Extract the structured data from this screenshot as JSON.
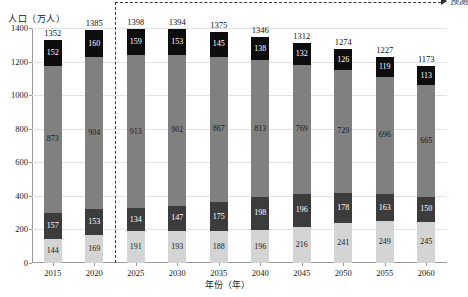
{
  "chart_data": {
    "type": "bar",
    "title": "",
    "subtype": "stacked",
    "xlabel": "年份（年）",
    "ylabel": "人口（万人）",
    "ylim": [
      0,
      1400
    ],
    "ytick_step": 200,
    "yticks": [
      "0",
      "200",
      "400",
      "600",
      "800",
      "1000",
      "1200",
      "1400"
    ],
    "grid": true,
    "legend_position": "none",
    "categories": [
      "2015",
      "2020",
      "2025",
      "2030",
      "2035",
      "2040",
      "2045",
      "2050",
      "2055",
      "2060"
    ],
    "series": [
      {
        "name": "segment-1",
        "color": "#d4d4d4",
        "values": [
          144,
          169,
          191,
          193,
          188,
          196,
          216,
          241,
          249,
          245
        ]
      },
      {
        "name": "segment-2",
        "color": "#3c3c3c",
        "values": [
          157,
          153,
          134,
          147,
          175,
          198,
          196,
          178,
          163,
          150
        ]
      },
      {
        "name": "segment-3",
        "color": "#808080",
        "values": [
          873,
          904,
          913,
          902,
          867,
          813,
          769,
          729,
          696,
          665
        ]
      },
      {
        "name": "segment-4",
        "color": "#0d0d0d",
        "values": [
          152,
          160,
          159,
          153,
          145,
          138,
          132,
          126,
          119,
          113
        ]
      }
    ],
    "totals": [
      1352,
      1385,
      1398,
      1394,
      1375,
      1346,
      1312,
      1274,
      1227,
      1173
    ],
    "annotations": {
      "forecast_label": "预测",
      "forecast_divider_after_category": "2020"
    }
  },
  "footnote": ""
}
